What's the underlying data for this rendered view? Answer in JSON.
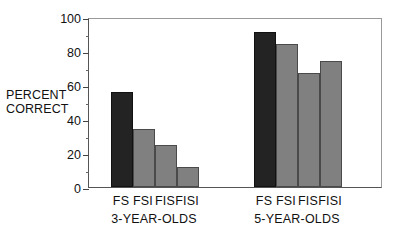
{
  "chart_data": {
    "type": "bar",
    "title": "",
    "xlabel": "",
    "ylabel": "PERCENT CORRECT",
    "ylabel_line1": "PERCENT",
    "ylabel_line2": "CORRECT",
    "ylim": [
      0,
      100
    ],
    "ytick_labels": [
      "0",
      "20",
      "40",
      "60",
      "80",
      "100"
    ],
    "ytick_values": [
      0,
      20,
      40,
      60,
      80,
      100
    ],
    "yminor_values": [
      10,
      30,
      50,
      70,
      90
    ],
    "grid": false,
    "legend": false,
    "categories": [
      "FS",
      "FSI",
      "FIS",
      "FISI"
    ],
    "groups": [
      {
        "name": "3-YEAR-OLDS",
        "label": "3-YEAR-OLDS",
        "bars": [
          {
            "category": "FS",
            "value": 56,
            "color": "#232323",
            "shade": "dark"
          },
          {
            "category": "FSI",
            "value": 34,
            "color": "#808080",
            "shade": "light"
          },
          {
            "category": "FIS",
            "value": 25,
            "color": "#808080",
            "shade": "light"
          },
          {
            "category": "FISI",
            "value": 12,
            "color": "#808080",
            "shade": "light"
          }
        ]
      },
      {
        "name": "5-YEAR-OLDS",
        "label": "5-YEAR-OLDS",
        "bars": [
          {
            "category": "FS",
            "value": 91,
            "color": "#232323",
            "shade": "dark"
          },
          {
            "category": "FSI",
            "value": 84,
            "color": "#808080",
            "shade": "light"
          },
          {
            "category": "FIS",
            "value": 67,
            "color": "#808080",
            "shade": "light"
          },
          {
            "category": "FISI",
            "value": 74,
            "color": "#808080",
            "shade": "light"
          }
        ]
      }
    ],
    "colors": {
      "dark_bar": "#232323",
      "light_bar": "#808080",
      "axis": "#444444",
      "background": "#ffffff"
    }
  }
}
